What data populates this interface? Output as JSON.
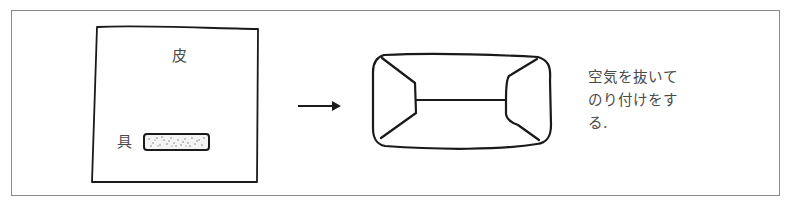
{
  "diagram": {
    "step_before": {
      "skin_label": "皮",
      "filling_label": "具"
    },
    "arrow": "right-arrow",
    "step_after": {
      "shape": "folded-pillow"
    },
    "caption_lines": [
      "空気を抜いて",
      "のり付けをす",
      "る."
    ],
    "colors": {
      "frame": "#8a8a8a",
      "stroke": "#1a1a1a",
      "text": "#4a4a4a"
    }
  }
}
